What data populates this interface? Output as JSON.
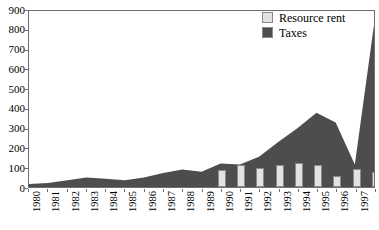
{
  "chart_data": {
    "type": "area",
    "title": "",
    "subtitle": "",
    "xlabel": "",
    "ylabel": "",
    "categories": [
      "1980",
      "1981",
      "1982",
      "1983",
      "1984",
      "1985",
      "1986",
      "1987",
      "1988",
      "1989",
      "1990",
      "1991",
      "1992",
      "1993",
      "1994",
      "1995",
      "1996",
      "1997",
      "1998"
    ],
    "ylim": [
      0,
      900
    ],
    "y_ticks": [
      0,
      100,
      200,
      300,
      400,
      500,
      600,
      700,
      800,
      900
    ],
    "y_tick_labels": [
      "0",
      "100",
      "200",
      "300",
      "400",
      "500",
      "600",
      "700",
      "800",
      "900"
    ],
    "grid": false,
    "legend_position": "top-right",
    "series": [
      {
        "name": "Taxes",
        "render": "area",
        "color": "#4d4d4d",
        "values": [
          15,
          20,
          35,
          48,
          42,
          35,
          48,
          72,
          90,
          78,
          120,
          115,
          155,
          230,
          300,
          380,
          330,
          115,
          830
        ]
      },
      {
        "name": "Resource rent",
        "render": "bar",
        "color": "#e2e2e2",
        "values": [
          null,
          null,
          null,
          null,
          null,
          null,
          null,
          null,
          null,
          null,
          85,
          112,
          96,
          112,
          122,
          112,
          55,
          92,
          75
        ]
      }
    ]
  },
  "legend": {
    "items": [
      {
        "label": "Resource rent",
        "color": "#e2e2e2"
      },
      {
        "label": "Taxes",
        "color": "#4d4d4d"
      }
    ]
  },
  "axes": {
    "y_label_0": "0",
    "y_label_100": "100",
    "y_label_200": "200",
    "y_label_300": "300",
    "y_label_400": "400",
    "y_label_500": "500",
    "y_label_600": "600",
    "y_label_700": "700",
    "y_label_800": "800",
    "y_label_900": "900"
  },
  "colors": {
    "area_fill": "#4d4d4d",
    "bar_fill": "#e2e2e2",
    "bar_stroke": "#8a8a8a",
    "frame": "#6e6e6e",
    "background": "#ffffff",
    "text": "#000000"
  }
}
